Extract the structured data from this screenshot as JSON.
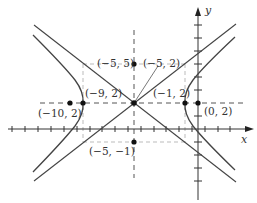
{
  "diagram": {
    "equation": "(x+5)^2/16 - (y-2)^2/9 = 1",
    "axes": {
      "x_label": "x",
      "y_label": "y"
    },
    "points": [
      {
        "id": "center",
        "label": "(−5, 2)",
        "x": -5,
        "y": 2
      },
      {
        "id": "vertex-left",
        "label": "(−9, 2)",
        "x": -9,
        "y": 2
      },
      {
        "id": "vertex-right",
        "label": "(−1, 2)",
        "x": -1,
        "y": 2
      },
      {
        "id": "focus-left",
        "label": "(−10, 2)",
        "x": -10,
        "y": 2
      },
      {
        "id": "focus-right",
        "label": "(0, 2)",
        "x": 0,
        "y": 2
      },
      {
        "id": "conj-top",
        "label": "(−5, 5)",
        "x": -5,
        "y": 5
      },
      {
        "id": "conj-bottom",
        "label": "(−5, −1)",
        "x": -5,
        "y": -1
      }
    ],
    "colors": {
      "curve": "#444444",
      "dashed": "#888888",
      "box": "#bbbbbb",
      "point": "#111111"
    }
  }
}
